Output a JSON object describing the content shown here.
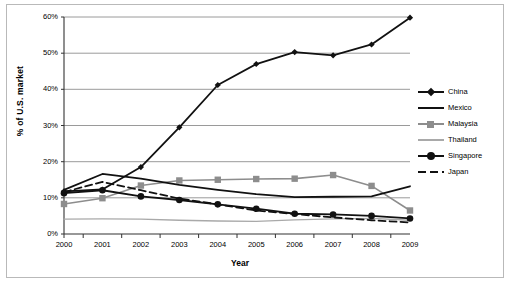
{
  "chart_data": {
    "type": "line",
    "title": "",
    "xlabel": "Year",
    "ylabel": "% of U.S. market",
    "x": [
      2000,
      2001,
      2002,
      2003,
      2004,
      2005,
      2006,
      2007,
      2008,
      2009
    ],
    "xtick_labels": [
      "2000",
      "2001",
      "2002",
      "2003",
      "2004",
      "2005",
      "2006",
      "2007",
      "2008",
      "2009"
    ],
    "ytick_labels": [
      "0%",
      "10%",
      "20%",
      "30%",
      "40%",
      "50%",
      "60%"
    ],
    "ytick_values": [
      0,
      10,
      20,
      30,
      40,
      50,
      60
    ],
    "ylim": [
      0,
      60
    ],
    "xlim": [
      2000,
      2009
    ],
    "grid": "horizontal",
    "legend_position": "right",
    "series": [
      {
        "name": "China",
        "color": "#111111",
        "marker": "diamond",
        "style": "solid",
        "values": [
          11.8,
          12.3,
          18.5,
          29.5,
          41.2,
          47.0,
          50.3,
          49.4,
          52.4,
          59.8
        ]
      },
      {
        "name": "Mexico",
        "color": "#111111",
        "marker": "none",
        "style": "solid",
        "values": [
          12.2,
          16.6,
          15.3,
          13.6,
          12.2,
          11.0,
          10.2,
          10.3,
          10.4,
          13.2
        ]
      },
      {
        "name": "Malaysia",
        "color": "#8d8d8d",
        "marker": "square",
        "style": "solid",
        "values": [
          8.3,
          9.9,
          13.4,
          14.8,
          15.0,
          15.2,
          15.3,
          16.3,
          13.3,
          6.5
        ]
      },
      {
        "name": "Thailand",
        "color": "#a9a9a9",
        "marker": "none",
        "style": "solid",
        "values": [
          4.1,
          4.2,
          4.1,
          3.8,
          3.6,
          3.5,
          3.9,
          4.2,
          4.3,
          3.8
        ]
      },
      {
        "name": "Singapore",
        "color": "#111111",
        "marker": "circle",
        "style": "solid",
        "values": [
          11.3,
          12.1,
          10.4,
          9.4,
          8.2,
          7.0,
          5.6,
          5.4,
          5.0,
          4.3
        ]
      },
      {
        "name": "Japan",
        "color": "#111111",
        "marker": "none",
        "style": "dashed",
        "values": [
          11.6,
          14.4,
          12.1,
          9.8,
          8.2,
          6.5,
          5.5,
          4.6,
          3.8,
          3.2
        ]
      }
    ]
  },
  "axis": {
    "ylabel": "% of U.S. market",
    "xlabel": "Year"
  },
  "legend": {
    "items": [
      {
        "label": "China"
      },
      {
        "label": "Mexico"
      },
      {
        "label": "Malaysia"
      },
      {
        "label": "Thailand"
      },
      {
        "label": "Singapore"
      },
      {
        "label": "Japan"
      }
    ]
  }
}
